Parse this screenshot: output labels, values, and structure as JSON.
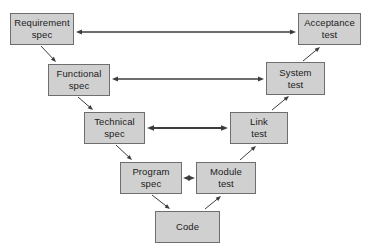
{
  "diagram": {
    "background_color": "#ffffff",
    "box_fill_color": "#d0d0d0",
    "box_border_color": "#6e6e6e",
    "text_color": "#1b1b1b",
    "arrow_color": "#3c3c3c",
    "nodes": [
      {
        "id": "requirement-spec",
        "line1": "Requirement",
        "line2": "spec",
        "x": 10,
        "y": 13,
        "w": 64,
        "h": 32,
        "side": "left",
        "level": 1
      },
      {
        "id": "acceptance-test",
        "line1": "Acceptance",
        "line2": "test",
        "x": 298,
        "y": 13,
        "w": 63,
        "h": 32,
        "side": "right",
        "level": 1
      },
      {
        "id": "functional-spec",
        "line1": "Functional",
        "line2": "spec",
        "x": 48,
        "y": 64,
        "w": 62,
        "h": 32,
        "side": "left",
        "level": 2
      },
      {
        "id": "system-test",
        "line1": "System",
        "line2": "test",
        "x": 266,
        "y": 62,
        "w": 59,
        "h": 33,
        "side": "right",
        "level": 2
      },
      {
        "id": "technical-spec",
        "line1": "Technical",
        "line2": "spec",
        "x": 84,
        "y": 112,
        "w": 61,
        "h": 32,
        "side": "left",
        "level": 3
      },
      {
        "id": "link-test",
        "line1": "Link",
        "line2": "test",
        "x": 230,
        "y": 112,
        "w": 58,
        "h": 32,
        "side": "right",
        "level": 3
      },
      {
        "id": "program-spec",
        "line1": "Program",
        "line2": "spec",
        "x": 120,
        "y": 162,
        "w": 62,
        "h": 32,
        "side": "left",
        "level": 4
      },
      {
        "id": "module-test",
        "line1": "Module",
        "line2": "test",
        "x": 196,
        "y": 162,
        "w": 60,
        "h": 32,
        "side": "right",
        "level": 4
      },
      {
        "id": "code",
        "line1": "Code",
        "line2": "",
        "x": 155,
        "y": 211,
        "w": 65,
        "h": 32,
        "side": "center",
        "level": 5
      }
    ],
    "connections": [
      {
        "id": "requirement-spec-to-acceptance-test",
        "from": "requirement-spec",
        "to": "acceptance-test",
        "kind": "horizontal",
        "heads": "both",
        "thickness": 1.6,
        "x1": 76,
        "y1": 32,
        "x2": 296,
        "y2": 32
      },
      {
        "id": "functional-spec-to-system-test",
        "from": "functional-spec",
        "to": "system-test",
        "kind": "horizontal",
        "heads": "both",
        "thickness": 1.6,
        "x1": 112,
        "y1": 79,
        "x2": 264,
        "y2": 79
      },
      {
        "id": "technical-spec-to-link-test",
        "from": "technical-spec",
        "to": "link-test",
        "kind": "horizontal",
        "heads": "both",
        "thickness": 2.2,
        "x1": 147,
        "y1": 128,
        "x2": 228,
        "y2": 128
      },
      {
        "id": "program-spec-to-module-test",
        "from": "program-spec",
        "to": "module-test",
        "kind": "horizontal",
        "heads": "both",
        "thickness": 2.2,
        "x1": 183,
        "y1": 178,
        "x2": 195,
        "y2": 178
      },
      {
        "id": "requirement-spec-to-functional-spec",
        "from": "requirement-spec",
        "to": "functional-spec",
        "kind": "diagonal",
        "heads": "end",
        "thickness": 1,
        "x1": 41,
        "y1": 46,
        "x2": 56,
        "y2": 62
      },
      {
        "id": "functional-spec-to-technical-spec",
        "from": "functional-spec",
        "to": "technical-spec",
        "kind": "diagonal",
        "heads": "end",
        "thickness": 1,
        "x1": 78,
        "y1": 97,
        "x2": 93,
        "y2": 110
      },
      {
        "id": "technical-spec-to-program-spec",
        "from": "technical-spec",
        "to": "program-spec",
        "kind": "diagonal",
        "heads": "end",
        "thickness": 1,
        "x1": 116,
        "y1": 145,
        "x2": 132,
        "y2": 160
      },
      {
        "id": "program-spec-to-code",
        "from": "program-spec",
        "to": "code",
        "kind": "diagonal",
        "heads": "end",
        "thickness": 1,
        "x1": 152,
        "y1": 195,
        "x2": 170,
        "y2": 209
      },
      {
        "id": "code-to-module-test",
        "from": "code",
        "to": "module-test",
        "kind": "diagonal",
        "heads": "end",
        "thickness": 1,
        "x1": 205,
        "y1": 209,
        "x2": 221,
        "y2": 196
      },
      {
        "id": "module-test-to-link-test",
        "from": "module-test",
        "to": "link-test",
        "kind": "diagonal",
        "heads": "end",
        "thickness": 1,
        "x1": 240,
        "y1": 160,
        "x2": 256,
        "y2": 146
      },
      {
        "id": "link-test-to-system-test",
        "from": "link-test",
        "to": "system-test",
        "kind": "diagonal",
        "heads": "end",
        "thickness": 1,
        "x1": 272,
        "y1": 110,
        "x2": 289,
        "y2": 96
      },
      {
        "id": "system-test-to-acceptance-test",
        "from": "system-test",
        "to": "acceptance-test",
        "kind": "diagonal",
        "heads": "end",
        "thickness": 1,
        "x1": 303,
        "y1": 61,
        "x2": 320,
        "y2": 47
      }
    ]
  }
}
